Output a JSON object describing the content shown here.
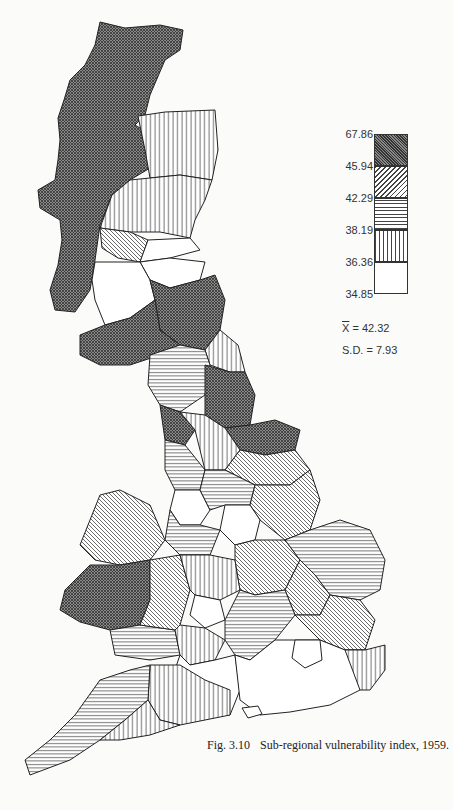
{
  "figure": {
    "number": "Fig. 3.10",
    "title": "Sub-regional vulnerability index, 1959."
  },
  "legend": {
    "breaks": [
      "67.86",
      "45.94",
      "42.29",
      "38.19",
      "36.36",
      "34.85"
    ],
    "classes": [
      {
        "range": "45.94 – 67.86",
        "pattern": "cross-hatch-dark",
        "fill": "#6e6e6e"
      },
      {
        "range": "42.29 – 45.94",
        "pattern": "diagonal-hatch",
        "fill": "#bdbdbd"
      },
      {
        "range": "38.19 – 42.29",
        "pattern": "horizontal-lines",
        "fill": "#d4d4d4"
      },
      {
        "range": "36.36 – 38.19",
        "pattern": "vertical-lines",
        "fill": "#e0e0e0"
      },
      {
        "range": "34.85 – 36.36",
        "pattern": "blank",
        "fill": "#ffffff"
      }
    ]
  },
  "stats": {
    "mean_label": "X",
    "mean_value": "= 42.32",
    "sd_text": "S.D. = 7.93"
  },
  "map": {
    "region": "Great Britain",
    "unit": "sub-regions"
  }
}
